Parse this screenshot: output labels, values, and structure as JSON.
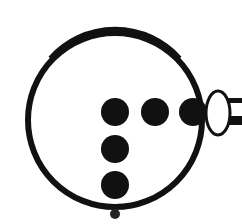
{
  "diagram": {
    "description": "Circle containing an L-shaped arrangement of black dots with an oval connector and tube on the right",
    "colors": {
      "ink": "#111111",
      "background": "#ffffff"
    },
    "outer_circle": {
      "cx": 115,
      "cy": 120,
      "r": 87,
      "stroke_width": 6
    },
    "dots": [
      {
        "cx": 115,
        "cy": 112,
        "r": 14
      },
      {
        "cx": 155,
        "cy": 112,
        "r": 14
      },
      {
        "cx": 193,
        "cy": 112,
        "r": 14
      },
      {
        "cx": 115,
        "cy": 149,
        "r": 14
      },
      {
        "cx": 115,
        "cy": 185,
        "r": 14
      }
    ],
    "small_dot": {
      "cx": 115,
      "cy": 214,
      "r": 5
    },
    "connector_oval": {
      "cx": 218,
      "cy": 113,
      "rx": 12,
      "ry": 22,
      "stroke_width": 3
    },
    "tube": {
      "x": 228,
      "y": 98,
      "width": 14,
      "height": 25
    }
  }
}
